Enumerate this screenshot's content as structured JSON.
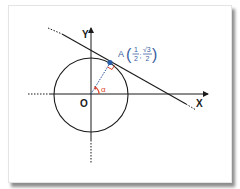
{
  "diagram": {
    "title": "",
    "axes": {
      "x_label": "X",
      "y_label": "Y",
      "origin_label": "O"
    },
    "circle": {
      "type": "unit-circle",
      "center": "O",
      "radius": 1
    },
    "point": {
      "name": "A",
      "x_num": "1",
      "x_den": "2",
      "y_num": "√3",
      "y_den": "2",
      "separator": ";",
      "coords": [
        0.5,
        0.866
      ]
    },
    "angle": {
      "symbol": "α",
      "degrees": 60
    },
    "tangent_line": {
      "through": "A",
      "perpendicular_to": "OA"
    },
    "right_angle_marker": true,
    "colors": {
      "point": "#2b5ea8",
      "label_point": "#3a5fa0",
      "angle": "#e0442c",
      "radius": "#2b4f9a",
      "lines": "#1a1a1a"
    }
  }
}
